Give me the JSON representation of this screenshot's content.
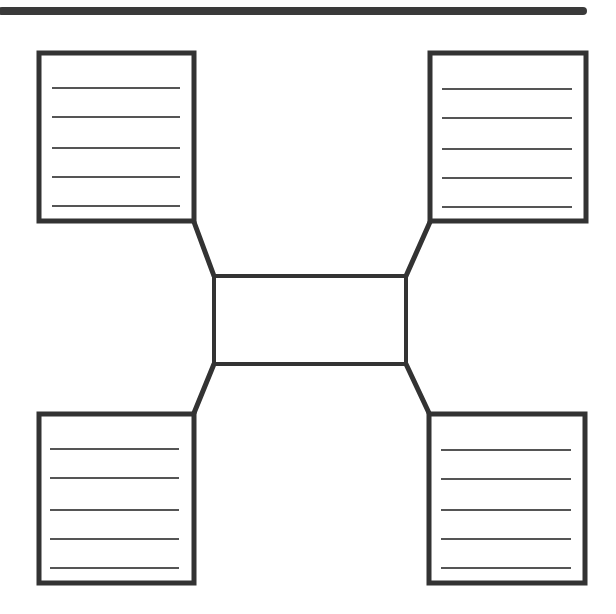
{
  "diagram": {
    "type": "four-square graphic organizer",
    "colors": {
      "stroke": "#333333",
      "rule": "#555555",
      "background": "#ffffff"
    },
    "top_bar": {
      "x1": 2,
      "y1": 11,
      "x2": 583,
      "y2": 11
    },
    "center_box": {
      "x": 214,
      "y": 276,
      "w": 192,
      "h": 88,
      "text": ""
    },
    "boxes": [
      {
        "id": "top-left",
        "x": 39,
        "y": 53,
        "w": 155,
        "h": 168,
        "lines": 5,
        "text": ""
      },
      {
        "id": "top-right",
        "x": 430,
        "y": 53,
        "w": 156,
        "h": 168,
        "lines": 5,
        "text": ""
      },
      {
        "id": "bottom-left",
        "x": 39,
        "y": 414,
        "w": 155,
        "h": 169,
        "lines": 5,
        "text": ""
      },
      {
        "id": "bottom-right",
        "x": 429,
        "y": 414,
        "w": 156,
        "h": 169,
        "lines": 5,
        "text": ""
      }
    ],
    "connectors": [
      {
        "from": "top-left",
        "x1": 194,
        "y1": 222,
        "x2": 214,
        "y2": 276
      },
      {
        "from": "top-right",
        "x1": 430,
        "y1": 222,
        "x2": 406,
        "y2": 276
      },
      {
        "from": "bottom-left",
        "x1": 194,
        "y1": 413,
        "x2": 214,
        "y2": 364
      },
      {
        "from": "bottom-right",
        "x1": 429,
        "y1": 413,
        "x2": 406,
        "y2": 364
      }
    ]
  }
}
